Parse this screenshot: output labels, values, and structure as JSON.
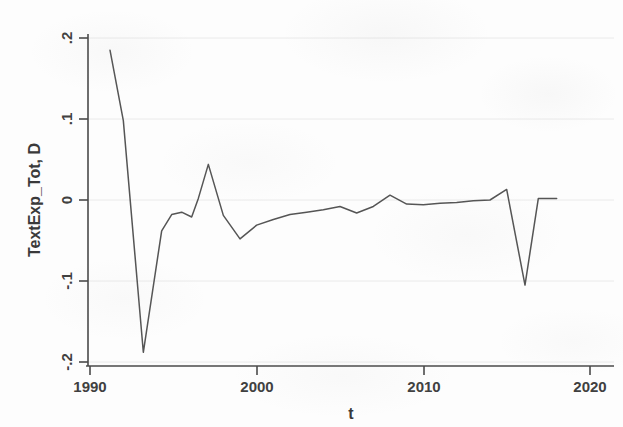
{
  "chart_data": {
    "type": "line",
    "title": "",
    "subtitle": "",
    "xlabel": "t",
    "ylabel": "TextExp_Tot, D",
    "xlim": [
      1990,
      2020
    ],
    "ylim": [
      -0.2,
      0.2
    ],
    "xticks": [
      1990,
      2000,
      2010,
      2020
    ],
    "xtick_labels": [
      "1990",
      "2000",
      "2010",
      "2020"
    ],
    "yticks": [
      -0.2,
      -0.1,
      0,
      0.1,
      0.2
    ],
    "ytick_labels": [
      "-.2",
      "-.1",
      "0",
      ".1",
      ".2"
    ],
    "grid": true,
    "grid_axis": "y",
    "legend": "none",
    "line_color": "#555555",
    "axis_color": "#4a4a4a",
    "grid_color": "#e8e8e8",
    "background_color": "#fdfdfd",
    "series": [
      {
        "name": "TextExp_Tot, D",
        "x": [
          1991.2,
          1992.0,
          1993.2,
          1994.3,
          1994.9,
          1995.5,
          1996.1,
          1996.5,
          1997.1,
          1998.0,
          1999.0,
          2000.0,
          2001.0,
          2002.0,
          2003.0,
          2004.0,
          2005.0,
          2006.0,
          2007.0,
          2008.0,
          2009.0,
          2010.0,
          2011.0,
          2012.0,
          2013.0,
          2014.0,
          2015.0,
          2016.1,
          2016.9,
          2017.6,
          2018.0
        ],
        "y": [
          0.185,
          0.098,
          -0.188,
          -0.038,
          -0.018,
          -0.015,
          -0.021,
          0.002,
          0.044,
          -0.019,
          -0.048,
          -0.031,
          -0.024,
          -0.018,
          -0.015,
          -0.012,
          -0.008,
          -0.016,
          -0.008,
          0.006,
          -0.005,
          -0.006,
          -0.004,
          -0.003,
          -0.001,
          0.0,
          0.013,
          -0.105,
          0.002,
          0.002,
          0.002
        ]
      }
    ],
    "annotations": [
      {
        "text": "peak at start ~.185 in 1991",
        "x": 1991.2,
        "y": 0.185
      },
      {
        "text": "deep trough ~-.188 in 1993",
        "x": 1993.2,
        "y": -0.188
      },
      {
        "text": "local peak ~.044 in 1997",
        "x": 1997.1,
        "y": 0.044
      },
      {
        "text": "dip ~-.048 in 1999",
        "x": 1999.0,
        "y": -0.048
      },
      {
        "text": "sharp drop ~-.105 in 2016",
        "x": 2016.1,
        "y": -0.105
      }
    ]
  }
}
